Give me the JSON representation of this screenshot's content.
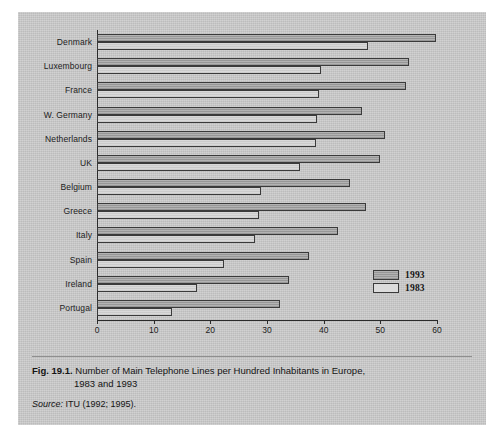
{
  "figure": {
    "fig_number": "Fig. 19.1.",
    "caption_line1": "Number of Main Telephone Lines per Hundred Inhabitants in Europe,",
    "caption_line2": "1983 and 1993",
    "source_label": "Source:",
    "source_text": "ITU (1992; 1995)."
  },
  "chart_data": {
    "type": "bar",
    "orientation": "horizontal",
    "title": "Number of Main Telephone Lines per Hundred Inhabitants in Europe, 1983 and 1993",
    "xlabel": "",
    "ylabel": "",
    "xlim": [
      0,
      60
    ],
    "xticks": [
      0,
      10,
      20,
      30,
      40,
      50,
      60
    ],
    "xtick_labels": [
      "0",
      "10",
      "20",
      "30",
      "40",
      "50",
      "60"
    ],
    "grid": false,
    "legend_position": "inside-bottom-right",
    "categories": [
      "Denmark",
      "Luxembourg",
      "France",
      "W. Germany",
      "Netherlands",
      "UK",
      "Belgium",
      "Greece",
      "Italy",
      "Spain",
      "Ireland",
      "Portugal"
    ],
    "series": [
      {
        "name": "1993",
        "color": "#a8a8a8",
        "values": [
          59.9,
          55.1,
          54.5,
          46.8,
          50.8,
          50.0,
          44.7,
          47.4,
          42.6,
          37.4,
          33.8,
          32.3
        ]
      },
      {
        "name": "1983",
        "color": "#d2d2d2",
        "values": [
          47.8,
          39.6,
          39.2,
          38.8,
          38.6,
          35.8,
          29.0,
          28.5,
          27.9,
          22.4,
          17.7,
          13.2
        ]
      }
    ]
  },
  "legend": {
    "entries": [
      {
        "label": "1993",
        "swatch": "shaded-gray"
      },
      {
        "label": "1983",
        "swatch": "white"
      }
    ]
  }
}
